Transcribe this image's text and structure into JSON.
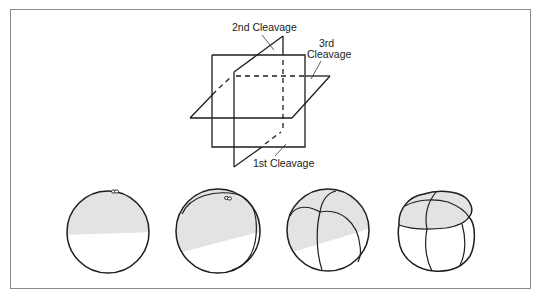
{
  "figure": {
    "colors": {
      "frame": "#8a8a8a",
      "line": "#1e1e1e",
      "shading": "#e3e3e6",
      "background": "#ffffff"
    }
  },
  "planes_diagram": {
    "labels": {
      "second": "2nd Cleavage",
      "third_line1": "3rd",
      "third_line2": "Cleavage",
      "first": "1st Cleavage"
    }
  },
  "stages": [
    {
      "id": "zygote",
      "cells": 1,
      "description": "Uncleaved egg with polar body; upper (animal) half shaded"
    },
    {
      "id": "two-cell",
      "cells": 2,
      "description": "After 1st cleavage; meridional furrow"
    },
    {
      "id": "four-cell",
      "cells": 4,
      "description": "After 2nd cleavage; second meridional furrow"
    },
    {
      "id": "eight-cell",
      "cells": 8,
      "description": "After 3rd cleavage; equatorial furrow separates shaded upper tier"
    }
  ]
}
